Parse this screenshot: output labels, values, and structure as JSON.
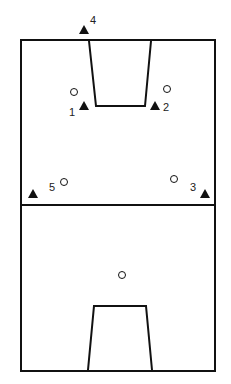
{
  "diagram": {
    "type": "court-positions",
    "court": {
      "left": 21,
      "top": 40,
      "right": 215,
      "bottom": 371,
      "midline_y": 205
    },
    "offense_markers": [
      {
        "label": "4",
        "x": 84,
        "y": 30,
        "label_x": 90,
        "label_y": 24
      },
      {
        "label": "1",
        "x": 84,
        "y": 106,
        "label_x": 69,
        "label_y": 116
      },
      {
        "label": "2",
        "x": 155,
        "y": 106,
        "label_x": 163,
        "label_y": 111
      },
      {
        "label": "5",
        "x": 33,
        "y": 194,
        "label_x": 49,
        "label_y": 191
      },
      {
        "label": "3",
        "x": 205,
        "y": 194,
        "label_x": 190,
        "label_y": 191
      }
    ],
    "defense_markers": [
      {
        "x": 74,
        "y": 92
      },
      {
        "x": 167,
        "y": 89
      },
      {
        "x": 64,
        "y": 182
      },
      {
        "x": 174,
        "y": 179
      },
      {
        "x": 122,
        "y": 275
      }
    ],
    "colors": {
      "line": "#111111",
      "marker": "#111111",
      "label": "#222222"
    }
  }
}
